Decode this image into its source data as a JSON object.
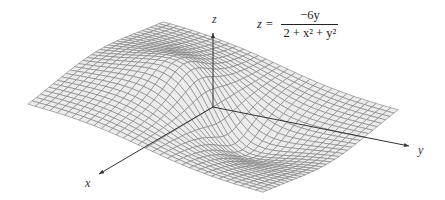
{
  "equation": {
    "lhs": "z =",
    "numerator": "−6y",
    "denominator": "2 + x² + y²"
  },
  "axes": {
    "x_label": "x",
    "y_label": "y",
    "z_label": "z"
  },
  "chart_data": {
    "type": "surface",
    "function": "z = -6*y/(2 + x^2 + y^2)",
    "x_range": [
      -4,
      4
    ],
    "y_range": [
      -4,
      4
    ],
    "grid_lines": 32,
    "axis_labels": {
      "x": "x",
      "y": "y",
      "z": "z"
    },
    "features": {
      "max": {
        "x": 0,
        "y": -1.414,
        "z": 2.121
      },
      "min": {
        "x": 0,
        "y": 1.414,
        "z": -2.121
      }
    },
    "projection": {
      "origin_px": [
        213,
        107
      ],
      "ex_px": [
        -16.9,
        10.3
      ],
      "ey_px": [
        29.4,
        7.9
      ],
      "ez_px": [
        0,
        -17.5
      ]
    },
    "colors": {
      "surface_fill": "#ececec",
      "grid_line": "#7a7a7a",
      "axis": "#333333"
    }
  }
}
